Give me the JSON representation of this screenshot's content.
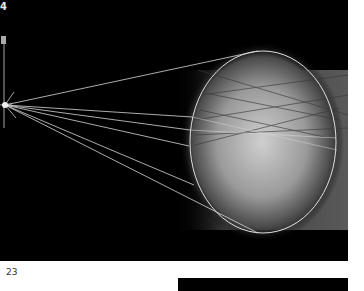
{
  "figure": {
    "corner_label": "4",
    "background_color": "#000000",
    "stroke_color": "#d8d8d8",
    "source_point": {
      "x": 5,
      "y": 105
    },
    "ellipse": {
      "cx": 263,
      "cy": 142,
      "rx": 73,
      "ry": 91
    },
    "rays": [
      {
        "x": 258,
        "y": 51
      },
      {
        "x": 192,
        "y": 117
      },
      {
        "x": 190,
        "y": 130
      },
      {
        "x": 189,
        "y": 146
      },
      {
        "x": 194,
        "y": 185
      },
      {
        "x": 258,
        "y": 233
      }
    ]
  },
  "page": {
    "page_number": "23"
  }
}
